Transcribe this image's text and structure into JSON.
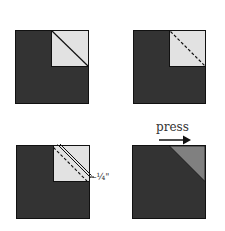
{
  "diagram": {
    "colors": {
      "dark_square": "#333333",
      "light_corner": "#e2e2e2",
      "pressed_corner": "#808080",
      "stroke": "#111111",
      "background": "#ffffff"
    },
    "steps": [
      {
        "id": 1,
        "description": "Light corner square with solid diagonal line"
      },
      {
        "id": 2,
        "description": "Light corner square with dashed diagonal sewing line"
      },
      {
        "id": 3,
        "description": "Trim line with 1/4 inch seam allowance",
        "annotation": "–¼\""
      },
      {
        "id": 4,
        "description": "Pressed corner triangle",
        "annotation": "press"
      }
    ],
    "labels": {
      "press": "press",
      "seam_allowance": "–¼\""
    }
  }
}
